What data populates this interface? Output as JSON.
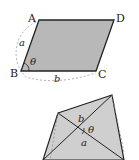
{
  "figure1": {
    "shape": "parallelogram",
    "vertices": {
      "A": "A",
      "B": "B",
      "C": "C",
      "D": "D"
    },
    "side_labels": {
      "AB": "a",
      "BC": "b"
    },
    "angle_label": "θ",
    "fill": "#b8b8b8",
    "stroke": "#222222"
  },
  "figure2": {
    "shape": "quadrilateral-with-diagonals",
    "diagonal_labels": {
      "upper": "b",
      "lower": "a"
    },
    "angle_label": "θ",
    "fill": "#cfcfcf",
    "stroke": "#222222"
  }
}
